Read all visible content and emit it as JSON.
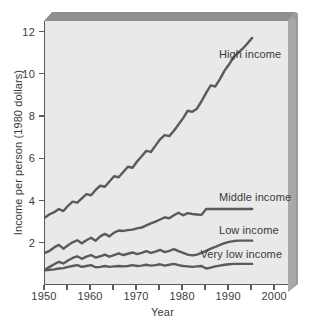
{
  "chart_data": {
    "type": "line",
    "title": "",
    "xlabel": "Year",
    "ylabel": "Income per person (1980 dollars)",
    "xlim": [
      1950,
      2003
    ],
    "ylim": [
      0,
      12.5
    ],
    "grid": false,
    "legend_position": "inline-right-of-series",
    "xticks": [
      1950,
      1960,
      1970,
      1980,
      1990,
      2000
    ],
    "xticks_minor": [
      1955,
      1965,
      1975,
      1985,
      1995
    ],
    "yticks": [
      2,
      4,
      6,
      8,
      10,
      12
    ],
    "x": [
      1950,
      1951,
      1952,
      1953,
      1954,
      1955,
      1956,
      1957,
      1958,
      1959,
      1960,
      1961,
      1962,
      1963,
      1964,
      1965,
      1966,
      1967,
      1968,
      1969,
      1970,
      1971,
      1972,
      1973,
      1974,
      1975,
      1976,
      1977,
      1978,
      1979,
      1980,
      1981,
      1982,
      1983,
      1984,
      1985,
      1986,
      1987,
      1988,
      1989,
      1990,
      1991,
      1992,
      1993,
      1994,
      1995
    ],
    "series": [
      {
        "name": "High income",
        "color": "#5a5a5a",
        "values": [
          3.2,
          3.35,
          3.45,
          3.6,
          3.5,
          3.75,
          3.95,
          3.9,
          4.1,
          4.3,
          4.25,
          4.5,
          4.7,
          4.65,
          4.9,
          5.15,
          5.1,
          5.35,
          5.6,
          5.55,
          5.85,
          6.1,
          6.35,
          6.3,
          6.6,
          6.9,
          7.1,
          7.05,
          7.3,
          7.6,
          7.9,
          8.25,
          8.2,
          8.35,
          8.7,
          9.1,
          9.45,
          9.4,
          9.75,
          10.15,
          10.45,
          10.8,
          11.0,
          11.2,
          11.45,
          11.7
        ]
      },
      {
        "name": "Middle income",
        "color": "#5a5a5a",
        "values": [
          1.52,
          1.62,
          1.78,
          1.9,
          1.72,
          1.88,
          2.02,
          2.12,
          1.98,
          2.12,
          2.24,
          2.1,
          2.3,
          2.42,
          2.3,
          2.48,
          2.58,
          2.56,
          2.6,
          2.62,
          2.68,
          2.72,
          2.82,
          2.92,
          3.0,
          3.1,
          3.2,
          3.16,
          3.3,
          3.42,
          3.3,
          3.4,
          3.36,
          3.34,
          3.32,
          3.6,
          3.6,
          3.6,
          3.6,
          3.6,
          3.6,
          3.6,
          3.6,
          3.6,
          3.6,
          3.6
        ]
      },
      {
        "name": "Low income",
        "color": "#5a5a5a",
        "values": [
          0.72,
          0.86,
          0.98,
          1.1,
          1.02,
          1.16,
          1.28,
          1.36,
          1.24,
          1.34,
          1.42,
          1.3,
          1.36,
          1.44,
          1.34,
          1.42,
          1.5,
          1.42,
          1.48,
          1.54,
          1.46,
          1.52,
          1.6,
          1.52,
          1.58,
          1.66,
          1.56,
          1.62,
          1.7,
          1.6,
          1.52,
          1.44,
          1.4,
          1.44,
          1.52,
          1.62,
          1.72,
          1.8,
          1.9,
          1.98,
          2.04,
          2.08,
          2.1,
          2.1,
          2.1,
          2.1
        ]
      },
      {
        "name": "Very low income",
        "color": "#5a5a5a",
        "values": [
          0.7,
          0.72,
          0.74,
          0.78,
          0.8,
          0.86,
          0.9,
          0.94,
          0.86,
          0.9,
          0.94,
          0.84,
          0.86,
          0.9,
          0.86,
          0.88,
          0.9,
          0.88,
          0.9,
          0.94,
          0.9,
          0.92,
          0.96,
          0.92,
          0.94,
          0.98,
          0.92,
          0.96,
          1.0,
          0.94,
          0.9,
          0.88,
          0.86,
          0.88,
          0.9,
          0.78,
          0.82,
          0.88,
          0.92,
          0.96,
          0.98,
          1.0,
          1.0,
          1.0,
          1.0,
          1.0
        ]
      }
    ],
    "annotations": [
      {
        "text": "High income",
        "x": 1988,
        "y": 10.9
      },
      {
        "text": "Middle income",
        "x": 1988,
        "y": 4.12
      },
      {
        "text": "Low income",
        "x": 1988,
        "y": 2.55
      },
      {
        "text": "Very low income",
        "x": 1984,
        "y": 1.42
      }
    ]
  },
  "style": {
    "plot_background": "#e9e9e9",
    "line_color": "#5a5a5a",
    "axis_color": "#5b5b5b",
    "frame_shadow": "#8f8f8f",
    "text_color": "#3a3a3a"
  }
}
